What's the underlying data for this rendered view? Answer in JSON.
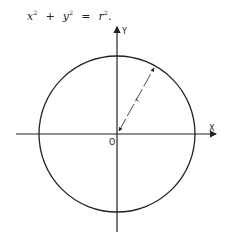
{
  "equation": {
    "x_var": "x",
    "y_var": "y",
    "r_var": "r",
    "exponent": "2",
    "plus": "+",
    "equals": "=",
    "end": "."
  },
  "diagram": {
    "x_axis_label": "X",
    "y_axis_label": "Y",
    "origin_label": "O",
    "radius_label": "r",
    "shape": "circle centered at origin",
    "line_color": "#222222",
    "background": "#ffffff"
  }
}
